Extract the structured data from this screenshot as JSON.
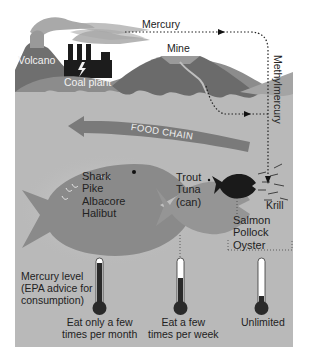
{
  "diagram": {
    "title": "",
    "sources": {
      "volcano": "Volcano",
      "coal_plant": "Coal plant",
      "mine": "Mine",
      "mercury": "Mercury",
      "methylmercury": "Methylmercury"
    },
    "food_chain_label": "FOOD CHAIN",
    "fish_groups": [
      {
        "id": "large",
        "species": [
          "Shark",
          "Pike",
          "Albacore",
          "Halibut"
        ],
        "advice": "Eat only a few times per month",
        "thermometer_level": "high"
      },
      {
        "id": "medium",
        "species": [
          "Trout",
          "Tuna",
          "(can)"
        ],
        "advice": "Eat a few times per week",
        "thermometer_level": "medium"
      },
      {
        "id": "small",
        "species": [
          "Salmon",
          "Pollock",
          "Oyster"
        ],
        "advice": "Unlimited",
        "thermometer_level": "low"
      }
    ],
    "krill_label": "Krill",
    "mercury_level_label": "Mercury level (EPA advice for consumption)",
    "mercury_level_lines": [
      "Mercury level",
      "(EPA advice for",
      "consumption)"
    ],
    "advice_lines": {
      "large": [
        "Eat only a few",
        "times per month"
      ],
      "medium": [
        "Eat a few",
        "times per week"
      ],
      "small": [
        "Unlimited"
      ]
    },
    "colors": {
      "sky": "#ffffff",
      "water": "#b9b9b9",
      "hills_dark": "#6f6f6f",
      "hills_mid": "#8c8c8c",
      "smoke": "#a8a8a8",
      "big_fish": "#8a8a8a",
      "mid_fish": "#959595",
      "small_fish": "#1a1a1a",
      "arrow": "#7a7a7a",
      "thermo_fill": "#2a2a2a"
    }
  }
}
